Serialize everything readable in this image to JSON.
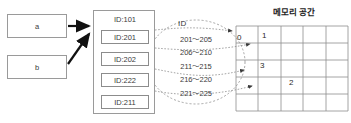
{
  "diagram": {
    "variables": [
      {
        "name": "var-a",
        "label": "a"
      },
      {
        "name": "var-b",
        "label": "b"
      }
    ],
    "object": {
      "header": "ID:101",
      "elements": [
        {
          "label": "ID:201"
        },
        {
          "label": "ID:202"
        },
        {
          "label": "ID:222"
        },
        {
          "label": "ID:211"
        }
      ]
    },
    "id_bubble": {
      "title": "ID",
      "ranges": [
        "201～205",
        "206～210",
        "211～215",
        "216～220",
        "221～225"
      ]
    },
    "memory": {
      "title": "메모리 공간",
      "slot_labels": [
        "0",
        "1",
        "2",
        "3"
      ],
      "columns": 5,
      "rows": 5
    },
    "colors": {
      "box_border": "#9a9a9a",
      "arrow_solid": "#111111",
      "connector_dotted": "#8e8e8e",
      "grid_line": "#8e8e8e",
      "text": "#3a3a3a"
    }
  }
}
